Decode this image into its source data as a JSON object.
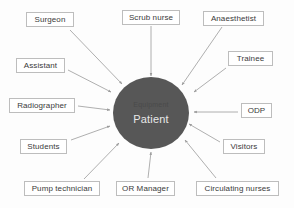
{
  "diagram": {
    "center": {
      "primary_label": "Patient",
      "secondary_label": "Equipment",
      "fill_color": "#575757",
      "primary_text_color": "#e8e8e8",
      "secondary_text_color": "#4a4a4a"
    },
    "box_style": {
      "border_color": "#bdbdbd",
      "background_color": "#ffffff",
      "text_color": "#3a3a3a"
    },
    "arrow_color": "#9a9a9a",
    "nodes": [
      {
        "id": "surgeon",
        "label": "Surgeon",
        "box": {
          "left": 26,
          "top": 12,
          "width": 48
        },
        "arrow": {
          "x1": 70,
          "y1": 30,
          "x2": 122,
          "y2": 84
        }
      },
      {
        "id": "scrub-nurse",
        "label": "Scrub nurse",
        "box": {
          "left": 122,
          "top": 10,
          "width": 58
        },
        "arrow": {
          "x1": 151,
          "y1": 26,
          "x2": 151,
          "y2": 76
        }
      },
      {
        "id": "anaesthetist",
        "label": "Anaesthetist",
        "box": {
          "left": 203,
          "top": 11,
          "width": 61
        },
        "arrow": {
          "x1": 222,
          "y1": 27,
          "x2": 182,
          "y2": 85
        }
      },
      {
        "id": "assistant",
        "label": "Assistant",
        "box": {
          "left": 16,
          "top": 58,
          "width": 49
        },
        "arrow": {
          "x1": 68,
          "y1": 70,
          "x2": 111,
          "y2": 92
        }
      },
      {
        "id": "trainee",
        "label": "Trainee",
        "box": {
          "left": 228,
          "top": 51,
          "width": 45
        },
        "arrow": {
          "x1": 226,
          "y1": 68,
          "x2": 194,
          "y2": 92
        }
      },
      {
        "id": "radiographer",
        "label": "Radiographer",
        "box": {
          "left": 9,
          "top": 98,
          "width": 66
        },
        "arrow": {
          "x1": 78,
          "y1": 106,
          "x2": 110,
          "y2": 110
        }
      },
      {
        "id": "odp",
        "label": "ODP",
        "box": {
          "left": 241,
          "top": 103,
          "width": 31
        },
        "arrow": {
          "x1": 238,
          "y1": 112,
          "x2": 194,
          "y2": 112
        }
      },
      {
        "id": "students",
        "label": "Students",
        "box": {
          "left": 20,
          "top": 139,
          "width": 47
        },
        "arrow": {
          "x1": 71,
          "y1": 140,
          "x2": 110,
          "y2": 126
        }
      },
      {
        "id": "visitors",
        "label": "Visitors",
        "box": {
          "left": 223,
          "top": 139,
          "width": 42
        },
        "arrow": {
          "x1": 220,
          "y1": 142,
          "x2": 189,
          "y2": 124
        }
      },
      {
        "id": "pump-technician",
        "label": "Pump technician",
        "box": {
          "left": 24,
          "top": 181,
          "width": 76
        },
        "arrow": {
          "x1": 84,
          "y1": 179,
          "x2": 119,
          "y2": 143
        }
      },
      {
        "id": "or-manager",
        "label": "OR Manager",
        "box": {
          "left": 116,
          "top": 181,
          "width": 59
        },
        "arrow": {
          "x1": 148,
          "y1": 178,
          "x2": 151,
          "y2": 152
        }
      },
      {
        "id": "circulating-nurses",
        "label": "Circulating nurses",
        "box": {
          "left": 196,
          "top": 181,
          "width": 83
        },
        "arrow": {
          "x1": 216,
          "y1": 178,
          "x2": 185,
          "y2": 140
        }
      }
    ]
  }
}
